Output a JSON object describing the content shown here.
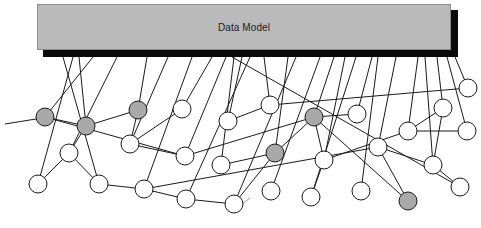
{
  "diagram": {
    "title": "Data Model",
    "colors": {
      "box_fill": "#bababa",
      "box_shadow": "#0a0a0a",
      "node_white": "#ffffff",
      "node_gray": "#a9a9a9",
      "stroke": "#1a1a1a"
    },
    "nodes": [
      {
        "id": "n1",
        "x": 45,
        "y": 117,
        "r": 9,
        "fill": "gray"
      },
      {
        "id": "n2",
        "x": 86,
        "y": 126,
        "r": 9,
        "fill": "gray"
      },
      {
        "id": "n3",
        "x": 69,
        "y": 153,
        "r": 9,
        "fill": "white"
      },
      {
        "id": "n4",
        "x": 38,
        "y": 184,
        "r": 9,
        "fill": "white"
      },
      {
        "id": "n5",
        "x": 99,
        "y": 184,
        "r": 9,
        "fill": "white"
      },
      {
        "id": "n6",
        "x": 138,
        "y": 110,
        "r": 9,
        "fill": "gray"
      },
      {
        "id": "n7",
        "x": 130,
        "y": 144,
        "r": 9,
        "fill": "white"
      },
      {
        "id": "n8",
        "x": 144,
        "y": 189,
        "r": 9,
        "fill": "white"
      },
      {
        "id": "n9",
        "x": 182,
        "y": 109,
        "r": 9,
        "fill": "white"
      },
      {
        "id": "n10",
        "x": 185,
        "y": 156,
        "r": 9,
        "fill": "white"
      },
      {
        "id": "n11",
        "x": 228,
        "y": 121,
        "r": 9,
        "fill": "white"
      },
      {
        "id": "n12",
        "x": 221,
        "y": 165,
        "r": 9,
        "fill": "white"
      },
      {
        "id": "n13",
        "x": 186,
        "y": 199,
        "r": 9,
        "fill": "white"
      },
      {
        "id": "n14",
        "x": 234,
        "y": 204,
        "r": 9,
        "fill": "white"
      },
      {
        "id": "n15",
        "x": 270,
        "y": 105,
        "r": 9,
        "fill": "white"
      },
      {
        "id": "n16",
        "x": 275,
        "y": 153,
        "r": 9,
        "fill": "gray"
      },
      {
        "id": "n17",
        "x": 271,
        "y": 191,
        "r": 9,
        "fill": "white"
      },
      {
        "id": "n18",
        "x": 314,
        "y": 117,
        "r": 9,
        "fill": "gray"
      },
      {
        "id": "n19",
        "x": 357,
        "y": 114,
        "r": 9,
        "fill": "white"
      },
      {
        "id": "n20",
        "x": 324,
        "y": 160,
        "r": 9,
        "fill": "white"
      },
      {
        "id": "n21",
        "x": 311,
        "y": 197,
        "r": 9,
        "fill": "white"
      },
      {
        "id": "n22",
        "x": 361,
        "y": 191,
        "r": 9,
        "fill": "white"
      },
      {
        "id": "n23",
        "x": 378,
        "y": 147,
        "r": 9,
        "fill": "white"
      },
      {
        "id": "n24",
        "x": 408,
        "y": 131,
        "r": 9,
        "fill": "white"
      },
      {
        "id": "n25",
        "x": 443,
        "y": 108,
        "r": 9,
        "fill": "white"
      },
      {
        "id": "n26",
        "x": 468,
        "y": 88,
        "r": 9,
        "fill": "white"
      },
      {
        "id": "n27",
        "x": 467,
        "y": 131,
        "r": 9,
        "fill": "white"
      },
      {
        "id": "n28",
        "x": 433,
        "y": 165,
        "r": 9,
        "fill": "white"
      },
      {
        "id": "n29",
        "x": 460,
        "y": 187,
        "r": 9,
        "fill": "white"
      },
      {
        "id": "n30",
        "x": 408,
        "y": 201,
        "r": 9,
        "fill": "gray"
      }
    ],
    "model_links": [
      [
        "n1",
        93
      ],
      [
        "n3",
        117
      ],
      [
        "n4",
        73
      ],
      [
        "n2",
        79
      ],
      [
        "n5",
        63
      ],
      [
        "n6",
        147
      ],
      [
        "n7",
        168
      ],
      [
        "n8",
        192
      ],
      [
        "n9",
        212
      ],
      [
        "n10",
        226
      ],
      [
        "n11",
        242
      ],
      [
        "n12",
        234
      ],
      [
        "n13",
        250
      ],
      [
        "n15",
        264
      ],
      [
        "n16",
        288
      ],
      [
        "n14",
        296
      ],
      [
        "n17",
        320
      ],
      [
        "n18",
        334
      ],
      [
        "n20",
        345
      ],
      [
        "n21",
        356
      ],
      [
        "n19",
        372
      ],
      [
        "n22",
        378
      ],
      [
        "n23",
        396
      ],
      [
        "n24",
        418
      ],
      [
        "n28",
        425
      ],
      [
        "n25",
        437
      ],
      [
        "n26",
        455
      ],
      [
        "n27",
        447
      ],
      [
        "n29",
        232
      ]
    ],
    "edges": [
      [
        "n1",
        "n2"
      ],
      [
        "n2",
        "n3"
      ],
      [
        "n3",
        "n4"
      ],
      [
        "n3",
        "n5"
      ],
      [
        "n2",
        "n6"
      ],
      [
        "n6",
        "n7"
      ],
      [
        "n7",
        "n10"
      ],
      [
        "n1",
        "n10"
      ],
      [
        "n10",
        "n18"
      ],
      [
        "n5",
        "n8"
      ],
      [
        "n8",
        "n13"
      ],
      [
        "n13",
        "n14"
      ],
      [
        "n14",
        "n16"
      ],
      [
        "n12",
        "n16"
      ],
      [
        "n11",
        "n15"
      ],
      [
        "n15",
        "n26"
      ],
      [
        "n16",
        "n18"
      ],
      [
        "n8",
        "n23"
      ],
      [
        "n18",
        "n19"
      ],
      [
        "n18",
        "n20"
      ],
      [
        "n20",
        "n21"
      ],
      [
        "n20",
        "n24"
      ],
      [
        "n18",
        "n30"
      ],
      [
        "n23",
        "n30"
      ],
      [
        "n23",
        "n28"
      ],
      [
        "n24",
        "n25"
      ],
      [
        "n24",
        "n27"
      ],
      [
        "n28",
        "n29"
      ],
      [
        "n9",
        "n7"
      ],
      [
        "n25",
        "n28"
      ]
    ],
    "stray_lines": [
      {
        "x1": 232,
        "y1": 212,
        "x2": 250,
        "y2": 198
      }
    ],
    "left_tail": {
      "x1": 5,
      "y1": 124,
      "x2": 36,
      "y2": 119
    }
  }
}
